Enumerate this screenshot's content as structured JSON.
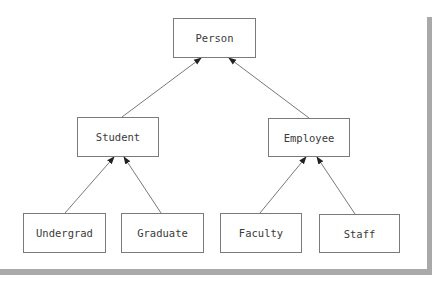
{
  "diagram": {
    "type": "class-hierarchy",
    "nodes": {
      "person": "Person",
      "student": "Student",
      "employee": "Employee",
      "undergrad": "Undergrad",
      "graduate": "Graduate",
      "faculty": "Faculty",
      "staff": "Staff"
    },
    "edges": [
      {
        "from": "Student",
        "to": "Person"
      },
      {
        "from": "Employee",
        "to": "Person"
      },
      {
        "from": "Undergrad",
        "to": "Student"
      },
      {
        "from": "Graduate",
        "to": "Student"
      },
      {
        "from": "Faculty",
        "to": "Employee"
      },
      {
        "from": "Staff",
        "to": "Employee"
      }
    ],
    "colors": {
      "border": "#7a7a7a",
      "frame": "#a9a9a9",
      "text": "#3a3a3a"
    }
  }
}
